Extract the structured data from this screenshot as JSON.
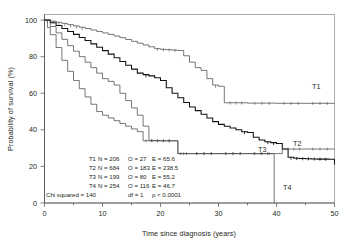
{
  "chart_data": {
    "type": "line",
    "title": "",
    "xlabel": "Time since diagnosis (years)",
    "ylabel": "Probability of survival (%)",
    "xlim": [
      0,
      50
    ],
    "ylim": [
      0,
      100
    ],
    "xticks": [
      0,
      10,
      20,
      30,
      40,
      50
    ],
    "xticks_minor": [
      5,
      15,
      25,
      35,
      45
    ],
    "yticks": [
      0,
      20,
      40,
      60,
      80,
      100
    ],
    "grid": false,
    "legend": "inline curve labels at right",
    "series": [
      {
        "name": "T1",
        "label": "T1",
        "N": 206,
        "O": 27,
        "E": 65.6,
        "points": [
          [
            0,
            100
          ],
          [
            1,
            99.4
          ],
          [
            2,
            98.8
          ],
          [
            3,
            98.2
          ],
          [
            4,
            97.5
          ],
          [
            5,
            96.8
          ],
          [
            6,
            96.1
          ],
          [
            7,
            95.4
          ],
          [
            8,
            94.6
          ],
          [
            9,
            93.8
          ],
          [
            10,
            93.0
          ],
          [
            11,
            92.2
          ],
          [
            12,
            91.3
          ],
          [
            13,
            90.4
          ],
          [
            14,
            89.4
          ],
          [
            15,
            88.4
          ],
          [
            16,
            87.4
          ],
          [
            17,
            86.4
          ],
          [
            18,
            85.4
          ],
          [
            19,
            84.4
          ],
          [
            20,
            84.0
          ],
          [
            21,
            83.8
          ],
          [
            22,
            83.6
          ],
          [
            23,
            83.4
          ],
          [
            24,
            80.5
          ],
          [
            25,
            77.0
          ],
          [
            26,
            74.0
          ],
          [
            27,
            72.5
          ],
          [
            28,
            68.0
          ],
          [
            29,
            64.5
          ],
          [
            30,
            63.8
          ],
          [
            31,
            54.8
          ],
          [
            35,
            54.6
          ],
          [
            40,
            54.5
          ],
          [
            45,
            54.5
          ],
          [
            50,
            54.5
          ]
        ]
      },
      {
        "name": "T2",
        "label": "T2",
        "N": 684,
        "O": 183,
        "E": 238.5,
        "points": [
          [
            0,
            100
          ],
          [
            1,
            98.5
          ],
          [
            2,
            97.0
          ],
          [
            3,
            95.4
          ],
          [
            4,
            93.8
          ],
          [
            5,
            92.2
          ],
          [
            6,
            90.5
          ],
          [
            7,
            88.8
          ],
          [
            8,
            87.0
          ],
          [
            9,
            85.2
          ],
          [
            10,
            83.3
          ],
          [
            11,
            81.4
          ],
          [
            12,
            79.4
          ],
          [
            13,
            77.4
          ],
          [
            14,
            75.3
          ],
          [
            15,
            73.2
          ],
          [
            16,
            71.0
          ],
          [
            17,
            70.2
          ],
          [
            18,
            69.5
          ],
          [
            19,
            68.5
          ],
          [
            20,
            67.0
          ],
          [
            21,
            63.0
          ],
          [
            22,
            60.0
          ],
          [
            23,
            57.5
          ],
          [
            24,
            55.0
          ],
          [
            25,
            52.5
          ],
          [
            26,
            50.5
          ],
          [
            27,
            48.5
          ],
          [
            28,
            46.5
          ],
          [
            29,
            44.5
          ],
          [
            30,
            43.0
          ],
          [
            31,
            42.0
          ],
          [
            32,
            41.0
          ],
          [
            33,
            40.0
          ],
          [
            34,
            39.0
          ],
          [
            35,
            38.5
          ],
          [
            36,
            36.0
          ],
          [
            37,
            34.5
          ],
          [
            38,
            33.5
          ],
          [
            39,
            33.0
          ],
          [
            40,
            32.5
          ],
          [
            41,
            29.5
          ],
          [
            42,
            25.0
          ],
          [
            43,
            24.5
          ],
          [
            44,
            24.3
          ],
          [
            45,
            24.2
          ],
          [
            46,
            24.1
          ],
          [
            47,
            24.0
          ],
          [
            48,
            24.0
          ],
          [
            49,
            23.9
          ],
          [
            50,
            21.0
          ]
        ]
      },
      {
        "name": "T3",
        "label": "T3",
        "N": 199,
        "O": 80,
        "E": 55.2,
        "points": [
          [
            0,
            100
          ],
          [
            1,
            96.5
          ],
          [
            2,
            93.0
          ],
          [
            3,
            89.5
          ],
          [
            4,
            86.0
          ],
          [
            5,
            83.0
          ],
          [
            6,
            80.0
          ],
          [
            7,
            77.0
          ],
          [
            8,
            74.0
          ],
          [
            9,
            71.0
          ],
          [
            10,
            68.0
          ],
          [
            11,
            66.5
          ],
          [
            12,
            64.5
          ],
          [
            13,
            60.0
          ],
          [
            14,
            56.0
          ],
          [
            15,
            52.0
          ],
          [
            16,
            48.0
          ],
          [
            17,
            42.0
          ],
          [
            18,
            34.2
          ],
          [
            19,
            34.1
          ],
          [
            20,
            34.0
          ],
          [
            21,
            34.0
          ],
          [
            22,
            34.0
          ],
          [
            23,
            27.0
          ],
          [
            24,
            27.0
          ],
          [
            25,
            27.0
          ],
          [
            30,
            27.0
          ],
          [
            35,
            27.0
          ],
          [
            40,
            27.0
          ],
          [
            41,
            29.5
          ],
          [
            45,
            29.5
          ],
          [
            50,
            29.5
          ]
        ]
      },
      {
        "name": "T4",
        "label": "T4",
        "N": 254,
        "O": 116,
        "E": 46.7,
        "points": [
          [
            0,
            100
          ],
          [
            0.5,
            96.0
          ],
          [
            1,
            92.0
          ],
          [
            2,
            85.0
          ],
          [
            3,
            78.0
          ],
          [
            4,
            72.0
          ],
          [
            5,
            67.0
          ],
          [
            6,
            62.5
          ],
          [
            7,
            58.0
          ],
          [
            8,
            54.0
          ],
          [
            9,
            50.0
          ],
          [
            10,
            48.0
          ],
          [
            11,
            46.5
          ],
          [
            12,
            45.0
          ],
          [
            13,
            43.5
          ],
          [
            14,
            42.0
          ],
          [
            15,
            40.5
          ],
          [
            16,
            39.0
          ],
          [
            17,
            34.0
          ],
          [
            18,
            34.0
          ],
          [
            19,
            34.0
          ],
          [
            20,
            34.0
          ],
          [
            21,
            34.0
          ],
          [
            22,
            34.0
          ],
          [
            23,
            27.0
          ],
          [
            25,
            27.0
          ],
          [
            30,
            27.0
          ],
          [
            35,
            27.0
          ],
          [
            39.6,
            27.0
          ],
          [
            39.6,
            0
          ]
        ]
      }
    ],
    "annotations": {
      "stats_rows": [
        {
          "group": "T1",
          "n": "N = 206",
          "o": "O = 27",
          "e": "E = 65.6"
        },
        {
          "group": "T2",
          "n": "N = 684",
          "o": "O = 183",
          "e": "E = 238.5"
        },
        {
          "group": "T3",
          "n": "N = 199",
          "o": "O = 80",
          "e": "E = 55.2"
        },
        {
          "group": "T4",
          "n": "N = 254",
          "o": "O = 116",
          "e": "E = 46.7"
        }
      ],
      "summary": {
        "chi": "Chi squared = 140",
        "df": "df = 1",
        "p": "p < 0.0001"
      }
    }
  },
  "colors": {
    "curve": "#4a4a4a",
    "curve_bold": "#111111",
    "axis": "#4d4d4d",
    "frame": "#8a8a8a",
    "text": "#231f20"
  }
}
